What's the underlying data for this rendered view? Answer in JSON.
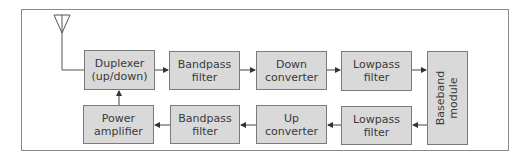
{
  "diagram": {
    "title": "",
    "type": "RF transceiver block diagram",
    "colors": {
      "box_fill": "#d9d9d9",
      "box_border": "#7a7a7a",
      "line": "#444444",
      "text": "#3a3a3a"
    },
    "antenna": {
      "label": ""
    },
    "blocks": {
      "duplexer": "Duplexer\n(up/down)",
      "rx_bandpass": "Bandpass\nfilter",
      "down_converter": "Down\nconverter",
      "rx_lowpass": "Lowpass\nfilter",
      "baseband": "Baseband\nmodule",
      "tx_lowpass": "Lowpass\nfilter",
      "up_converter": "Up\nconverter",
      "tx_bandpass": "Bandpass\nfilter",
      "power_amplifier": "Power\namplifier"
    },
    "connections": [
      [
        "antenna",
        "duplexer"
      ],
      [
        "duplexer",
        "rx_bandpass"
      ],
      [
        "rx_bandpass",
        "down_converter"
      ],
      [
        "down_converter",
        "rx_lowpass"
      ],
      [
        "rx_lowpass",
        "baseband"
      ],
      [
        "baseband",
        "tx_lowpass"
      ],
      [
        "tx_lowpass",
        "up_converter"
      ],
      [
        "up_converter",
        "tx_bandpass"
      ],
      [
        "tx_bandpass",
        "power_amplifier"
      ],
      [
        "power_amplifier",
        "duplexer"
      ]
    ]
  }
}
